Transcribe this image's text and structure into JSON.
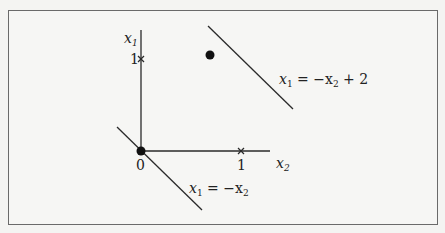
{
  "diagram": {
    "axes": {
      "vertical_label": "x",
      "vertical_label_sub": "1",
      "horizontal_label": "x",
      "horizontal_label_sub": "2",
      "origin_label": "0",
      "x_tick_label": "1",
      "y_tick_label": "1"
    },
    "lines": [
      {
        "name": "upper-line",
        "equation_lhs": "x",
        "lhs_sub": "1",
        "equation_rhs_a": " = −x",
        "rhs_sub": "2",
        "equation_rhs_b": " + 2"
      },
      {
        "name": "lower-line",
        "equation_lhs": "x",
        "lhs_sub": "1",
        "equation_rhs_a": " = −x",
        "rhs_sub": "2",
        "equation_rhs_b": ""
      }
    ],
    "points": [
      {
        "name": "origin-point",
        "x2": 0,
        "x1": 0
      },
      {
        "name": "upper-line-point",
        "x2": 0.7,
        "x1": 1.05
      }
    ],
    "tick_marks": [
      "x1 = 1 (cross)",
      "x2 = 1 (cross)"
    ],
    "colors": {
      "stroke": "#2a2a2a",
      "frame": "#6a6a6a",
      "background": "#f6f6f4"
    }
  }
}
